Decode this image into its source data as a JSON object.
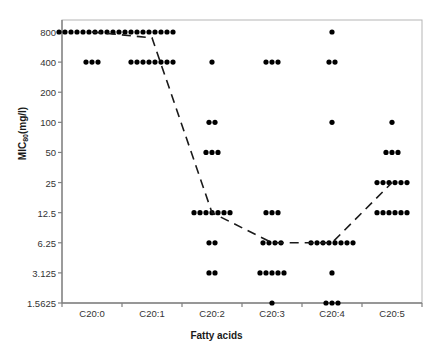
{
  "chart_data": {
    "type": "scatter",
    "title": "",
    "xlabel": "Fatty acids",
    "ylabel": "MIC80(mg/l)",
    "ylabel_base": "MIC",
    "ylabel_sub": "80",
    "ylabel_unit": "(mg/l)",
    "categories": [
      "C20:0",
      "C20:1",
      "C20:2",
      "C20:3",
      "C20:4",
      "C20:5"
    ],
    "y_tick_labels": [
      "800",
      "400",
      "200",
      "100",
      "50",
      "25",
      "12.5",
      "6.25",
      "3.125",
      "1.5625"
    ],
    "y_tick_values": [
      800,
      400,
      200,
      100,
      50,
      25,
      12.5,
      6.25,
      3.125,
      1.5625
    ],
    "y_scale": "log2-categorical",
    "grid": false,
    "legend": false,
    "point_color": "#000000",
    "trend_color": "#1a1a1a",
    "axis_color": "#808080",
    "series": [
      {
        "name": "C20:0",
        "points": [
          {
            "value": 800,
            "count": 12
          },
          {
            "value": 400,
            "count": 3
          }
        ]
      },
      {
        "name": "C20:1",
        "points": [
          {
            "value": 800,
            "count": 8
          },
          {
            "value": 400,
            "count": 8
          }
        ]
      },
      {
        "name": "C20:2",
        "points": [
          {
            "value": 400,
            "count": 1
          },
          {
            "value": 100,
            "count": 2
          },
          {
            "value": 50,
            "count": 3
          },
          {
            "value": 12.5,
            "count": 7
          },
          {
            "value": 6.25,
            "count": 2
          },
          {
            "value": 3.125,
            "count": 2
          }
        ]
      },
      {
        "name": "C20:3",
        "points": [
          {
            "value": 400,
            "count": 3
          },
          {
            "value": 12.5,
            "count": 3
          },
          {
            "value": 6.25,
            "count": 4
          },
          {
            "value": 3.125,
            "count": 5
          },
          {
            "value": 1.5625,
            "count": 1
          }
        ]
      },
      {
        "name": "C20:4",
        "points": [
          {
            "value": 800,
            "count": 1
          },
          {
            "value": 400,
            "count": 2
          },
          {
            "value": 100,
            "count": 1
          },
          {
            "value": 6.25,
            "count": 8
          },
          {
            "value": 3.125,
            "count": 1
          },
          {
            "value": 1.5625,
            "count": 3
          }
        ]
      },
      {
        "name": "C20:5",
        "points": [
          {
            "value": 100,
            "count": 1
          },
          {
            "value": 50,
            "count": 3
          },
          {
            "value": 25,
            "count": 6
          },
          {
            "value": 12.5,
            "count": 6
          }
        ]
      }
    ],
    "trend_line": {
      "style": "dashed",
      "values": [
        800,
        700,
        12.5,
        6.25,
        6.25,
        25
      ]
    }
  }
}
